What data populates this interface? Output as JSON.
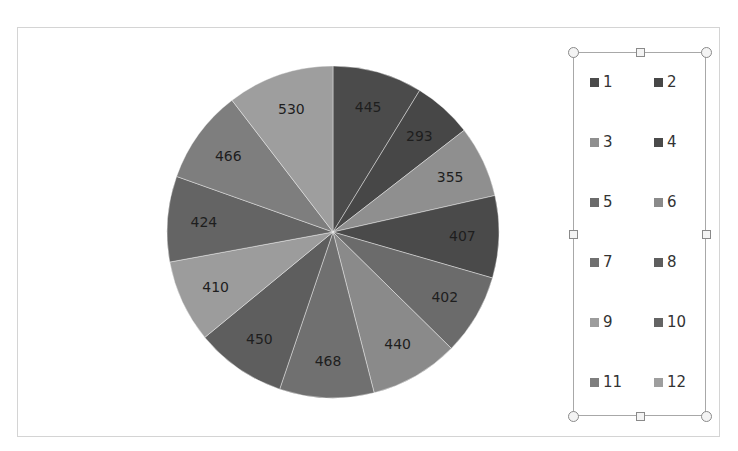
{
  "chart_data": {
    "type": "pie",
    "title": "",
    "categories": [
      "1",
      "2",
      "3",
      "4",
      "5",
      "6",
      "7",
      "8",
      "9",
      "10",
      "11",
      "12"
    ],
    "values": [
      445,
      293,
      355,
      407,
      402,
      440,
      468,
      450,
      410,
      424,
      466,
      530
    ],
    "labels": [
      "445",
      "293",
      "355",
      "407",
      "402",
      "440",
      "468",
      "450",
      "410",
      "424",
      "466",
      "530"
    ],
    "colors": [
      "#4b4b4b",
      "#474747",
      "#8f8f8f",
      "#4a4a4a",
      "#6b6b6b",
      "#8a8a8a",
      "#707070",
      "#5e5e5e",
      "#9c9c9c",
      "#646464",
      "#7e7e7e",
      "#9e9e9e"
    ],
    "start_angle_deg": 0,
    "direction": "clockwise",
    "legend_position": "right",
    "data_labels": true
  },
  "legend": {
    "items": [
      {
        "label": "1"
      },
      {
        "label": "2"
      },
      {
        "label": "3"
      },
      {
        "label": "4"
      },
      {
        "label": "5"
      },
      {
        "label": "6"
      },
      {
        "label": "7"
      },
      {
        "label": "8"
      },
      {
        "label": "9"
      },
      {
        "label": "10"
      },
      {
        "label": "11"
      },
      {
        "label": "12"
      }
    ],
    "selected": true
  }
}
